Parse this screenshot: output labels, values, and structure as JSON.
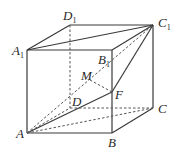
{
  "diagram": {
    "type": "geometry-cube",
    "colors": {
      "line": "#3a3a3a",
      "dashed": "#555555",
      "background": "#ffffff"
    },
    "vertices": {
      "A": {
        "label": "A",
        "sub": "",
        "x": 27,
        "y": 133
      },
      "B": {
        "label": "B",
        "sub": "",
        "x": 112,
        "y": 133
      },
      "C": {
        "label": "C",
        "sub": "",
        "x": 153,
        "y": 108
      },
      "D": {
        "label": "D",
        "sub": "",
        "x": 70,
        "y": 108
      },
      "A1": {
        "label": "A",
        "sub": "1",
        "x": 27,
        "y": 50
      },
      "B1": {
        "label": "B",
        "sub": "1",
        "x": 112,
        "y": 50
      },
      "C1": {
        "label": "C",
        "sub": "1",
        "x": 153,
        "y": 25
      },
      "D1": {
        "label": "D",
        "sub": "1",
        "x": 70,
        "y": 25
      },
      "M": {
        "label": "M",
        "sub": "",
        "x": 90,
        "y": 80
      },
      "F": {
        "label": "F",
        "sub": "",
        "x": 112,
        "y": 92
      }
    },
    "solid_edges": [
      [
        "A1",
        "B1"
      ],
      [
        "A1",
        "D1"
      ],
      [
        "D1",
        "C1"
      ],
      [
        "B1",
        "C1"
      ],
      [
        "A1",
        "C1"
      ],
      [
        "A",
        "A1"
      ],
      [
        "B",
        "B1"
      ],
      [
        "C",
        "C1"
      ],
      [
        "A",
        "B"
      ],
      [
        "B",
        "C"
      ],
      [
        "A",
        "F"
      ],
      [
        "F",
        "C1"
      ]
    ],
    "dashed_edges": [
      [
        "D1",
        "D"
      ],
      [
        "A",
        "D"
      ],
      [
        "D",
        "C"
      ],
      [
        "A",
        "C"
      ],
      [
        "A",
        "C1"
      ],
      [
        "M",
        "F"
      ]
    ]
  }
}
